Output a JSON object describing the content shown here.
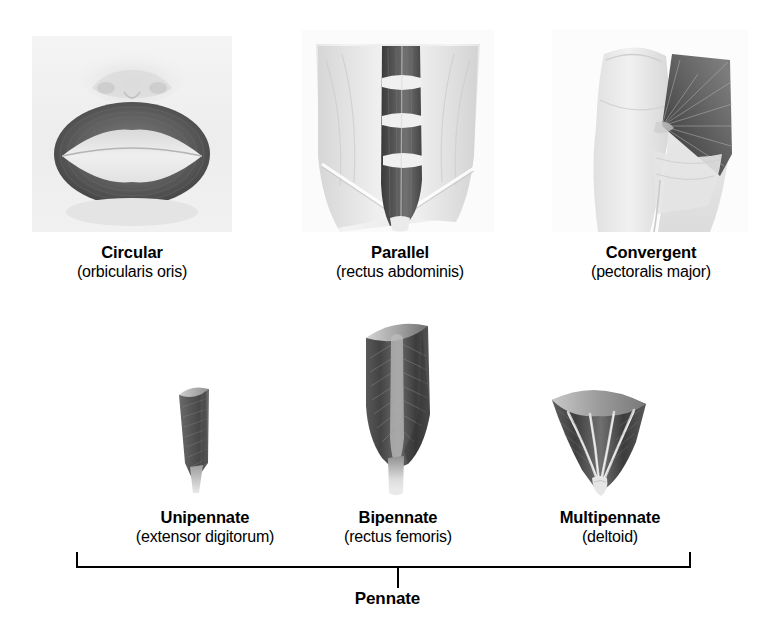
{
  "figure": {
    "group_label": "Pennate",
    "rows": [
      {
        "row_id": "non-pennate",
        "items": [
          {
            "id": "circular",
            "title": "Circular",
            "subtitle": "(orbicularis oris)",
            "art": "circular-muscle-orbicularis-oris-illustration"
          },
          {
            "id": "parallel",
            "title": "Parallel",
            "subtitle": "(rectus abdominis)",
            "art": "parallel-muscle-rectus-abdominis-illustration"
          },
          {
            "id": "convergent",
            "title": "Convergent",
            "subtitle": "(pectoralis major)",
            "art": "convergent-muscle-pectoralis-major-illustration"
          }
        ]
      },
      {
        "row_id": "pennate",
        "items": [
          {
            "id": "unipennate",
            "title": "Unipennate",
            "subtitle": "(extensor digitorum)",
            "art": "unipennate-muscle-extensor-digitorum-illustration"
          },
          {
            "id": "bipennate",
            "title": "Bipennate",
            "subtitle": "(rectus femoris)",
            "art": "bipennate-muscle-rectus-femoris-illustration"
          },
          {
            "id": "multipennate",
            "title": "Multipennate",
            "subtitle": "(deltoid)",
            "art": "multipennate-muscle-deltoid-illustration"
          }
        ]
      }
    ]
  },
  "colors": {
    "background": "#ffffff",
    "text": "#000000",
    "rule": "#000000",
    "plate_light": "#f2f2f2",
    "muscle_dark": "#4a4a4a",
    "muscle_mid": "#8d8d8d",
    "tendon_light": "#e8e8e8"
  }
}
